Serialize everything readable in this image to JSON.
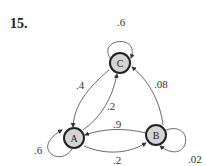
{
  "problem_number": "15.",
  "diagram": {
    "type": "state-transition-diagram",
    "node_fill": "#d4d4d4",
    "node_stroke": "#222222",
    "nodes": [
      {
        "id": "C",
        "label": "C"
      },
      {
        "id": "A",
        "label": "A"
      },
      {
        "id": "B",
        "label": "B"
      }
    ],
    "edges": [
      {
        "from": "C",
        "to": "C",
        "label": ".6"
      },
      {
        "from": "C",
        "to": "A",
        "label": ".4"
      },
      {
        "from": "A",
        "to": "C",
        "label": ".2"
      },
      {
        "from": "B",
        "to": "C",
        "label": ".08"
      },
      {
        "from": "B",
        "to": "A",
        "label": ".9"
      },
      {
        "from": "A",
        "to": "B",
        "label": ".2"
      },
      {
        "from": "A",
        "to": "A",
        "label": ".6"
      },
      {
        "from": "B",
        "to": "B",
        "label": ".02"
      }
    ]
  }
}
